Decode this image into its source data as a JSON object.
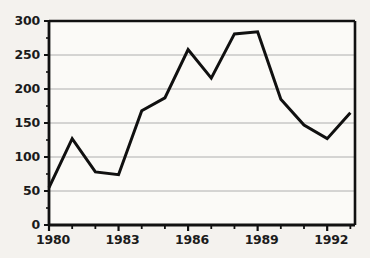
{
  "chart_data": {
    "type": "line",
    "title": "",
    "subtitle": "",
    "xlabel": "",
    "ylabel": "",
    "x": [
      1980,
      1981,
      1982,
      1983,
      1984,
      1985,
      1986,
      1987,
      1988,
      1989,
      1990,
      1991,
      1992,
      1993
    ],
    "values": [
      55,
      127,
      78,
      74,
      168,
      187,
      258,
      216,
      281,
      284,
      185,
      147,
      127,
      165
    ],
    "series": [
      {
        "name": "series-1",
        "values": [
          55,
          127,
          78,
          74,
          168,
          187,
          258,
          216,
          281,
          284,
          185,
          147,
          127,
          165
        ]
      }
    ],
    "xlim": [
      1980,
      1993.2
    ],
    "ylim": [
      0,
      300
    ],
    "x_tick_labels": [
      "1980",
      "1983",
      "1986",
      "1989",
      "1992"
    ],
    "x_tick_values": [
      1980,
      1983,
      1986,
      1989,
      1992
    ],
    "x_minor_tick_values": [
      1981,
      1982,
      1984,
      1985,
      1987,
      1988,
      1990,
      1991,
      1993
    ],
    "y_tick_labels": [
      "0",
      "50",
      "100",
      "150",
      "200",
      "250",
      "300"
    ],
    "y_tick_values": [
      0,
      50,
      100,
      150,
      200,
      250,
      300
    ],
    "y_minor_tick_values": [
      25,
      75,
      125,
      175,
      225,
      275
    ],
    "grid": "horizontal",
    "legend": "none",
    "annotations": []
  },
  "style": {
    "line_color": "#101010",
    "grid_color": "#aeaeae",
    "axis_color": "#111111",
    "background_color": "#f4f2ee",
    "plot_background_color": "#fbfaf7",
    "label_color": "#1b1b1b"
  },
  "axis_labels": {
    "y": [
      {
        "text": "300"
      },
      {
        "text": "250"
      },
      {
        "text": "200"
      },
      {
        "text": "150"
      },
      {
        "text": "100"
      },
      {
        "text": "50"
      },
      {
        "text": "0"
      }
    ],
    "x": [
      {
        "text": "1980"
      },
      {
        "text": "1983"
      },
      {
        "text": "1986"
      },
      {
        "text": "1989"
      },
      {
        "text": "1992"
      }
    ]
  }
}
